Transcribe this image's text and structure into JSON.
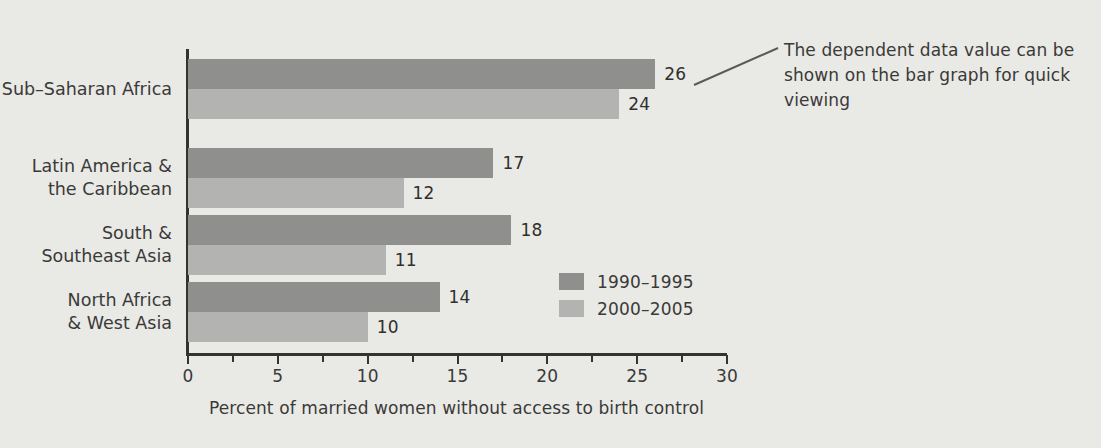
{
  "chart_data": {
    "type": "bar",
    "orientation": "horizontal",
    "title": "",
    "xlabel": "Percent of married women without access to birth control",
    "ylabel": "",
    "xlim": [
      0,
      30
    ],
    "grid": false,
    "legend_position": "inside-right-middle",
    "x_ticks_major": [
      0,
      5,
      10,
      15,
      20,
      25,
      30
    ],
    "x_tick_labels": [
      "0",
      "5",
      "10",
      "15",
      "20",
      "25",
      "30"
    ],
    "x_ticks_minor": [
      2.5,
      7.5,
      12.5,
      17.5,
      22.5,
      27.5
    ],
    "categories": [
      "Sub–Saharan Africa",
      "Latin America &\nthe Caribbean",
      "South &\nSoutheast Asia",
      "North Africa\n& West Asia"
    ],
    "category_lines": [
      [
        "Sub–Saharan Africa"
      ],
      [
        "Latin America &",
        "the Caribbean"
      ],
      [
        "South &",
        "Southeast Asia"
      ],
      [
        "North Africa",
        "& West Asia"
      ]
    ],
    "series": [
      {
        "name": "1990–1995",
        "color": "#8f8f8d",
        "values": [
          26,
          17,
          18,
          14
        ]
      },
      {
        "name": "2000–2005",
        "color": "#b3b3b1",
        "values": [
          24,
          12,
          11,
          10
        ]
      }
    ],
    "data_labels": [
      [
        "26",
        "17",
        "18",
        "14"
      ],
      [
        "24",
        "12",
        "11",
        "10"
      ]
    ]
  },
  "annotation": {
    "text": "The dependent data value can be shown on the bar graph for quick viewing",
    "leader_line": "callout-leader-line"
  },
  "colors": {
    "background": "#e9e9e6",
    "axis": "#35332f",
    "text": "#3a3a38",
    "series_1990_1995": "#8f8f8d",
    "series_2000_2005": "#b3b3b1"
  }
}
